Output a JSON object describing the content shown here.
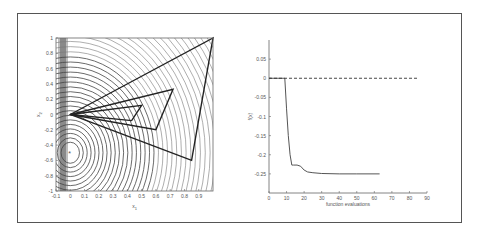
{
  "chart_data": [
    {
      "type": "line",
      "title": "",
      "xlabel": "x1",
      "ylabel": "x2",
      "xlim": [
        -0.1,
        1.0
      ],
      "ylim": [
        -1.0,
        1.0
      ],
      "xticks": [
        "-0.1",
        "0",
        "0.1",
        "0.2",
        "0.3",
        "0.4",
        "0.5",
        "0.6",
        "0.7",
        "0.8",
        "0.9"
      ],
      "yticks": [
        "1",
        "0.8",
        "0.6",
        "0.4",
        "0.2",
        "0",
        "-0.2",
        "-0.4",
        "-0.6",
        "-0.8",
        "-1"
      ],
      "background": "contour lines of objective function (circular contours centred near (0,-0.5))",
      "series": [
        {
          "name": "simplex triangles",
          "polygons": [
            [
              [
                0,
                0
              ],
              [
                1.0,
                1.0
              ],
              [
                0.85,
                -0.6
              ]
            ],
            [
              [
                0,
                0
              ],
              [
                0.72,
                0.33
              ],
              [
                0.6,
                -0.2
              ]
            ],
            [
              [
                0,
                0
              ],
              [
                0.5,
                0.12
              ],
              [
                0.43,
                -0.08
              ]
            ]
          ]
        },
        {
          "name": "minimum",
          "points": [
            [
              0,
              -0.5
            ]
          ],
          "marker": "*"
        }
      ],
      "grid": false
    },
    {
      "type": "line",
      "title": "",
      "xlabel": "function evaluations",
      "ylabel": "f(x)",
      "xlim": [
        0,
        90
      ],
      "ylim": [
        -0.3,
        0.1
      ],
      "xticks": [
        "0",
        "10",
        "20",
        "30",
        "40",
        "50",
        "60",
        "70",
        "80",
        "90"
      ],
      "yticks": [
        "0.05",
        "0",
        "-0.05",
        "-0.1",
        "-0.15",
        "-0.2",
        "-0.25"
      ],
      "series": [
        {
          "name": "f(x)",
          "style": "solid",
          "x": [
            0,
            9,
            10,
            11,
            12,
            13,
            14,
            16,
            18,
            20,
            22,
            25,
            30,
            40,
            50,
            63
          ],
          "y": [
            0,
            0,
            -0.08,
            -0.15,
            -0.2,
            -0.227,
            -0.227,
            -0.227,
            -0.23,
            -0.24,
            -0.245,
            -0.247,
            -0.249,
            -0.25,
            -0.25,
            -0.25
          ]
        },
        {
          "name": "reference",
          "style": "dashed",
          "x": [
            0,
            85
          ],
          "y": [
            0,
            0
          ]
        }
      ],
      "grid": false
    }
  ]
}
